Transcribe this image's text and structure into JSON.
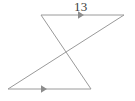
{
  "figure": {
    "background_color": "#ffffff",
    "stroke_color": "#9a9a9a",
    "stroke_width": 1,
    "text_color": "#3d3d3d",
    "labels": [
      {
        "id": "top-length",
        "text": "13",
        "x": 74,
        "y": 0,
        "font_size": 13
      }
    ],
    "vertices": [
      {
        "id": "top-left",
        "x": 41,
        "y": 15
      },
      {
        "id": "top-right",
        "x": 124,
        "y": 15
      },
      {
        "id": "bottom-left",
        "x": 8,
        "y": 89
      },
      {
        "id": "bottom-right",
        "x": 91,
        "y": 89
      },
      {
        "id": "intersection",
        "x": 67,
        "y": 52
      }
    ],
    "segments": [
      {
        "id": "top-side",
        "from": "top-left",
        "to": "top-right",
        "path": "M 41 15 L 124 15",
        "arrow": "mid-right"
      },
      {
        "id": "left-transversal",
        "from": "top-left",
        "to": "bottom-right",
        "path": "M 41 15 L 91 89",
        "arrow": "none"
      },
      {
        "id": "right-transversal",
        "from": "top-right",
        "to": "bottom-left",
        "path": "M 124 15 L 8 89",
        "arrow": "none"
      },
      {
        "id": "bottom-side",
        "from": "bottom-left",
        "to": "bottom-right",
        "path": "M 8 89 L 91 89",
        "arrow": "mid-right"
      }
    ],
    "arrowheads": [
      {
        "id": "top-side-arrow",
        "x": 78,
        "y": 15,
        "direction": "right",
        "size": 6
      },
      {
        "id": "bottom-side-arrow",
        "x": 41,
        "y": 89,
        "direction": "right",
        "size": 6
      }
    ]
  }
}
